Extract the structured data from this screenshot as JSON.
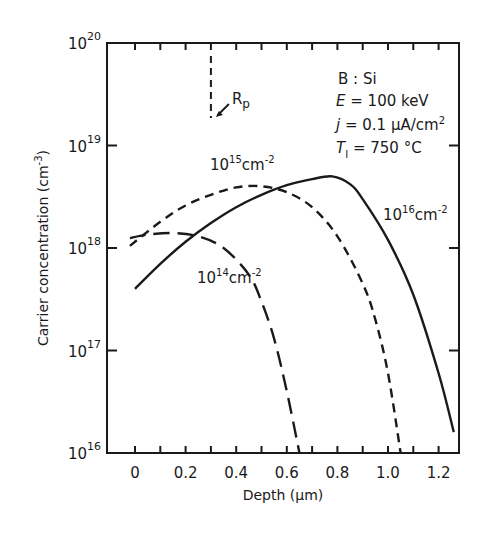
{
  "chart_data": {
    "type": "line",
    "title": "",
    "xlabel": "Depth (µm)",
    "ylabel": "Carrier concentration (cm⁻³)",
    "xlim": [
      -0.11,
      1.3
    ],
    "ylim": [
      1e+16,
      1e+20
    ],
    "yscale": "log",
    "grid": false,
    "x_ticks": [
      0,
      0.2,
      0.4,
      0.6,
      0.8,
      1.0,
      1.2
    ],
    "x_tick_labels": [
      "0",
      "0.2",
      "0.4",
      "0.6",
      "0.8",
      "1.0",
      "1.2"
    ],
    "y_ticks": [
      1e+16,
      1e+17,
      1e+18,
      1e+19,
      1e+20
    ],
    "y_tick_labels": [
      {
        "base": "10",
        "exp": "16"
      },
      {
        "base": "10",
        "exp": "17"
      },
      {
        "base": "10",
        "exp": "18"
      },
      {
        "base": "10",
        "exp": "19"
      },
      {
        "base": "10",
        "exp": "20"
      }
    ],
    "series": [
      {
        "name": "10^16 cm^-2",
        "label_base": "10",
        "label_exp": "16",
        "label_unit": "cm",
        "label_unit_exp": "-2",
        "style": "solid",
        "x": [
          0,
          0.1,
          0.2,
          0.3,
          0.4,
          0.5,
          0.6,
          0.7,
          0.78,
          0.85,
          0.9,
          1.0,
          1.1,
          1.2,
          1.26
        ],
        "y": [
          4e+17,
          7e+17,
          1.15e+18,
          1.75e+18,
          2.5e+18,
          3.3e+18,
          4.1e+18,
          4.7e+18,
          5e+18,
          4.2e+18,
          3e+18,
          1.2e+18,
          3.5e+17,
          6e+16,
          1.6e+16
        ]
      },
      {
        "name": "10^15 cm^-2",
        "label_base": "10",
        "label_exp": "15",
        "label_unit": "cm",
        "label_unit_exp": "-2",
        "style": "short-dash",
        "x": [
          -0.02,
          0.1,
          0.2,
          0.3,
          0.4,
          0.5,
          0.6,
          0.7,
          0.8,
          0.9,
          0.95,
          1.0,
          1.05
        ],
        "y": [
          1.05e+18,
          1.8e+18,
          2.6e+18,
          3.3e+18,
          3.9e+18,
          4e+18,
          3.5e+18,
          2.5e+18,
          1.3e+18,
          4.5e+17,
          2e+17,
          6e+16,
          1e+16
        ]
      },
      {
        "name": "10^14 cm^-2",
        "label_base": "10",
        "label_exp": "14",
        "label_unit": "cm",
        "label_unit_exp": "-2",
        "style": "long-dash",
        "x": [
          -0.02,
          0.05,
          0.15,
          0.25,
          0.35,
          0.45,
          0.5,
          0.55,
          0.6,
          0.65
        ],
        "y": [
          1.25e+18,
          1.35e+18,
          1.4e+18,
          1.3e+18,
          1e+18,
          5.5e+17,
          3e+17,
          1.3e+17,
          4e+16,
          1e+16
        ]
      }
    ],
    "annotations": {
      "rp_label": "R",
      "rp_sub": "p",
      "rp_depth": 0.3,
      "conditions": {
        "line1": "B : Si",
        "line2_sym": "E",
        "line2_val": " = 100 keV",
        "line3_sym": "j",
        "line3_val": " = 0.1 µA/cm",
        "line3_exp": "2",
        "line4_sym": "T",
        "line4_sub": "I",
        "line4_val": " = 750 °C"
      }
    }
  },
  "axis": {
    "x_title": "Depth (µm)",
    "y_title_main": "Carrier concentration (cm",
    "y_title_exp": "-3",
    "y_title_close": ")"
  },
  "colors": {
    "ink": "#1a1a1a",
    "background": "#ffffff"
  }
}
